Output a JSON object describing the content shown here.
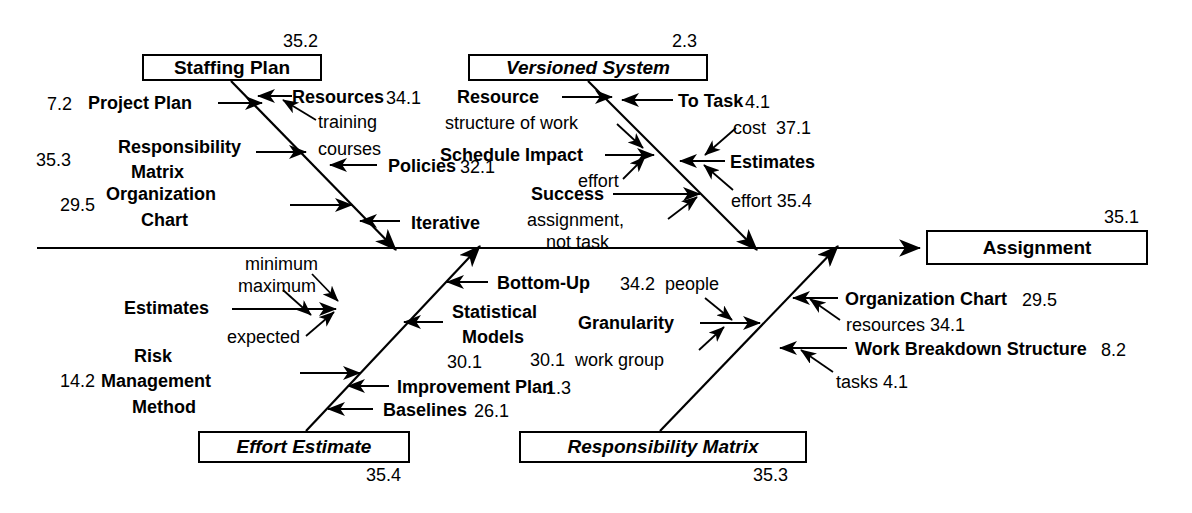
{
  "diagram": {
    "type": "fishbone-ishikawa",
    "title_effect": "Assignment",
    "effect_ref": "35.1",
    "spine": {
      "x1": 37,
      "y1": 248,
      "x2": 926,
      "y2": 248
    },
    "categories": [
      {
        "name": "Staffing Plan",
        "ref": "35.2",
        "position": "top-left",
        "italic": false,
        "causes": [
          {
            "label": "Project Plan",
            "ref": "7.2",
            "ref_side": "left",
            "side": "left"
          },
          {
            "label": "Resources",
            "ref": "34.1",
            "ref_side": "right",
            "side": "right",
            "sub": [
              "training",
              "courses"
            ]
          },
          {
            "label": "Responsibility Matrix",
            "ref": "35.3",
            "ref_side": "left",
            "side": "left"
          },
          {
            "label": "Policies",
            "ref": "32.1",
            "ref_side": "right",
            "side": "right"
          },
          {
            "label": "Organization Chart",
            "ref": "29.5",
            "ref_side": "left",
            "side": "left"
          },
          {
            "label": "Iterative",
            "ref": "",
            "ref_side": "right",
            "side": "right"
          }
        ]
      },
      {
        "name": "Versioned System",
        "ref": "2.3",
        "position": "top-middle",
        "italic": true,
        "causes": [
          {
            "label": "Resource",
            "ref": "",
            "side": "left",
            "sub": [
              "structure of work"
            ]
          },
          {
            "label": "To Task",
            "ref": "4.1",
            "ref_side": "right",
            "side": "right",
            "sub": [
              "cost  37.1"
            ]
          },
          {
            "label": "Schedule Impact",
            "ref": "",
            "side": "left",
            "sub": [
              "effort"
            ]
          },
          {
            "label": "Estimates",
            "ref": "",
            "side": "right",
            "sub": [
              "effort 35.4"
            ]
          },
          {
            "label": "Success",
            "ref": "",
            "side": "left",
            "sub": [
              "assignment,",
              "not task"
            ]
          }
        ]
      },
      {
        "name": "Effort Estimate",
        "ref": "35.4",
        "position": "bottom-left",
        "italic": true,
        "causes": [
          {
            "label": "Estimates",
            "ref": "",
            "side": "left",
            "sub": [
              "minimum",
              "maximum",
              "expected"
            ]
          },
          {
            "label": "Bottom-Up",
            "ref": "",
            "side": "right"
          },
          {
            "label": "Statistical Models",
            "ref": "30.1",
            "ref_side": "below",
            "side": "right"
          },
          {
            "label": "Risk Management Method",
            "ref": "14.2",
            "ref_side": "left",
            "side": "left"
          },
          {
            "label": "Improvement Plan",
            "ref": "1.3",
            "ref_side": "right",
            "side": "right"
          },
          {
            "label": "Baselines",
            "ref": "26.1",
            "ref_side": "right",
            "side": "right"
          }
        ]
      },
      {
        "name": "Responsibility Matrix",
        "ref": "35.3",
        "position": "bottom-middle",
        "italic": true,
        "causes": [
          {
            "label": "Granularity",
            "ref": "",
            "side": "left",
            "sub": [
              "34.2 people",
              "30.1 work group"
            ]
          },
          {
            "label": "Organization Chart",
            "ref": "29.5",
            "ref_side": "right",
            "side": "right",
            "sub": [
              "resources 34.1"
            ]
          },
          {
            "label": "Work Breakdown Structure",
            "ref": "8.2",
            "ref_side": "right",
            "side": "right",
            "sub": [
              "tasks 4.1"
            ]
          }
        ]
      }
    ]
  },
  "boxes": {
    "staffing_plan": {
      "label": "Staffing Plan",
      "ref": "35.2"
    },
    "versioned_system": {
      "label": "Versioned System",
      "ref": "2.3"
    },
    "effort_estimate": {
      "label": "Effort Estimate",
      "ref": "35.4"
    },
    "responsibility_matrix": {
      "label": "Responsibility Matrix",
      "ref": "35.3"
    },
    "assignment": {
      "label": "Assignment",
      "ref": "35.1"
    }
  },
  "labels": {
    "r_7_2": "7.2",
    "project_plan": "Project Plan",
    "resources": "Resources",
    "r_34_1": "34.1",
    "training": "training",
    "courses": "courses",
    "r_35_3": "35.3",
    "responsibility": "Responsibility",
    "matrix": "Matrix",
    "policies": "Policies",
    "r_32_1": "32.1",
    "r_29_5": "29.5",
    "organization": "Organization",
    "chart": "Chart",
    "iterative": "Iterative",
    "resource": "Resource",
    "structure_of_work": "structure of work",
    "to_task": "To Task",
    "r_4_1": "4.1",
    "cost": "cost",
    "r_37_1": "37.1",
    "schedule_impact": "Schedule Impact",
    "effort": "effort",
    "estimates_mid": "Estimates",
    "effort_35_4": "effort 35.4",
    "success": "Success",
    "assignment_comma": "assignment,",
    "not_task": "not task",
    "minimum": "minimum",
    "maximum": "maximum",
    "estimates_low": "Estimates",
    "expected": "expected",
    "bottom_up": "Bottom-Up",
    "statistical": "Statistical",
    "models": "Models",
    "r_30_1": "30.1",
    "work_group": "work group",
    "r_34_2": "34.2",
    "people": "people",
    "granularity": "Granularity",
    "risk": "Risk",
    "r_14_2": "14.2",
    "management": "Management",
    "method": "Method",
    "improvement_plan": "Improvement Plan",
    "r_1_3": "1.3",
    "baselines": "Baselines",
    "r_26_1": "26.1",
    "organization_chart": "Organization Chart",
    "r_29_5b": "29.5",
    "resources_low": "resources 34.1",
    "wbs": "Work Breakdown Structure",
    "r_8_2": "8.2",
    "tasks_41": "tasks 4.1"
  },
  "colors": {
    "line": "#000000",
    "text": "#000000",
    "background": "#ffffff"
  }
}
